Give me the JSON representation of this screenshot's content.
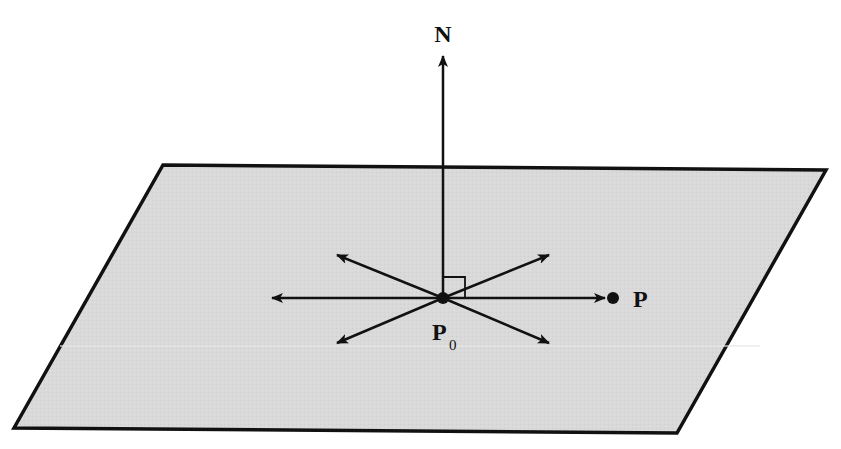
{
  "diagram": {
    "colors": {
      "background": "#ffffff",
      "plane_fill": "#d9d9d9",
      "stroke": "#111111"
    },
    "plane": {
      "corners": [
        [
          163,
          165
        ],
        [
          826,
          170
        ],
        [
          677,
          433
        ],
        [
          14,
          428
        ]
      ]
    },
    "origin_point": {
      "x": 443,
      "y": 298
    },
    "normal_vector": {
      "label": "N",
      "tip": [
        443,
        55
      ]
    },
    "point_P": {
      "label": "P",
      "x": 612,
      "y": 298
    },
    "point_P0": {
      "label": "P",
      "subscript": "0"
    },
    "in_plane_vectors": [
      {
        "name": "left",
        "tip": [
          271,
          298
        ]
      },
      {
        "name": "upper-left",
        "tip": [
          336,
          255
        ]
      },
      {
        "name": "upper-right",
        "tip": [
          550,
          255
        ]
      },
      {
        "name": "lower-left",
        "tip": [
          336,
          343
        ]
      },
      {
        "name": "lower-right",
        "tip": [
          550,
          343
        ]
      },
      {
        "name": "to-P",
        "tip": [
          604,
          298
        ]
      }
    ],
    "right_angle_marker": {
      "size": 21
    }
  }
}
